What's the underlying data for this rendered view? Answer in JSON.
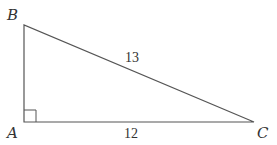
{
  "diagram": {
    "type": "right-triangle",
    "vertices": {
      "A": {
        "label": "A",
        "x": 24,
        "y": 122
      },
      "B": {
        "label": "B",
        "x": 24,
        "y": 25
      },
      "C": {
        "label": "C",
        "x": 254,
        "y": 122
      }
    },
    "sides": {
      "hypotenuse_BC": "13",
      "base_AC": "12"
    },
    "right_angle_at": "A",
    "stroke_color": "#555555"
  }
}
